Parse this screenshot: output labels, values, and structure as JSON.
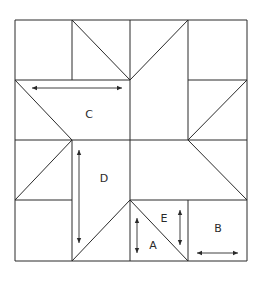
{
  "diagram": {
    "stroke_color": "#2a2a2a",
    "background": "#ffffff",
    "outer_square": {
      "x1": 15,
      "y1": 20,
      "x2": 247,
      "y2": 261
    },
    "grid": {
      "x": [
        15,
        72,
        130,
        188,
        247
      ],
      "y": [
        20,
        80,
        140,
        200,
        261
      ]
    },
    "segments": [
      {
        "name": "top-edge",
        "x1": 15,
        "y1": 20,
        "x2": 247,
        "y2": 20
      },
      {
        "name": "bottom-edge",
        "x1": 15,
        "y1": 261,
        "x2": 247,
        "y2": 261
      },
      {
        "name": "left-edge",
        "x1": 15,
        "y1": 20,
        "x2": 15,
        "y2": 261
      },
      {
        "name": "right-edge",
        "x1": 247,
        "y1": 20,
        "x2": 247,
        "y2": 261
      },
      {
        "name": "row1-v-72",
        "x1": 72,
        "y1": 20,
        "x2": 72,
        "y2": 80
      },
      {
        "name": "row1-v-130",
        "x1": 130,
        "y1": 20,
        "x2": 130,
        "y2": 80
      },
      {
        "name": "row1-v-188",
        "x1": 188,
        "y1": 20,
        "x2": 188,
        "y2": 80
      },
      {
        "name": "row1-diag-left",
        "x1": 72,
        "y1": 20,
        "x2": 130,
        "y2": 80
      },
      {
        "name": "row1-diag-right",
        "x1": 130,
        "y1": 80,
        "x2": 188,
        "y2": 20
      },
      {
        "name": "h80-left",
        "x1": 15,
        "y1": 80,
        "x2": 130,
        "y2": 80
      },
      {
        "name": "h80-right",
        "x1": 188,
        "y1": 80,
        "x2": 247,
        "y2": 80
      },
      {
        "name": "row2-diag-left",
        "x1": 15,
        "y1": 80,
        "x2": 72,
        "y2": 140
      },
      {
        "name": "row2-v-130",
        "x1": 130,
        "y1": 80,
        "x2": 130,
        "y2": 140
      },
      {
        "name": "row2-v-188",
        "x1": 188,
        "y1": 80,
        "x2": 188,
        "y2": 140
      },
      {
        "name": "row2-diag-right",
        "x1": 188,
        "y1": 140,
        "x2": 247,
        "y2": 80
      },
      {
        "name": "h140-full",
        "x1": 15,
        "y1": 140,
        "x2": 247,
        "y2": 140
      },
      {
        "name": "row3-diag-left",
        "x1": 72,
        "y1": 140,
        "x2": 15,
        "y2": 200
      },
      {
        "name": "v72-lower",
        "x1": 72,
        "y1": 140,
        "x2": 72,
        "y2": 261
      },
      {
        "name": "v130-lower",
        "x1": 130,
        "y1": 140,
        "x2": 130,
        "y2": 261
      },
      {
        "name": "row3-diag-right",
        "x1": 188,
        "y1": 140,
        "x2": 247,
        "y2": 200
      },
      {
        "name": "h200-left",
        "x1": 15,
        "y1": 200,
        "x2": 72,
        "y2": 200
      },
      {
        "name": "h200-right",
        "x1": 130,
        "y1": 200,
        "x2": 247,
        "y2": 200
      },
      {
        "name": "row4-diag-left",
        "x1": 130,
        "y1": 200,
        "x2": 72,
        "y2": 261
      },
      {
        "name": "row4-diag-right",
        "x1": 130,
        "y1": 200,
        "x2": 188,
        "y2": 261
      },
      {
        "name": "row4-v-188",
        "x1": 188,
        "y1": 200,
        "x2": 188,
        "y2": 261
      }
    ],
    "labels": [
      {
        "name": "label-c",
        "text": "C",
        "x": 89,
        "y": 114
      },
      {
        "name": "label-d",
        "text": "D",
        "x": 104,
        "y": 178
      },
      {
        "name": "label-e",
        "text": "E",
        "x": 164,
        "y": 218
      },
      {
        "name": "label-a",
        "text": "A",
        "x": 153,
        "y": 245
      },
      {
        "name": "label-b",
        "text": "B",
        "x": 218,
        "y": 228
      }
    ],
    "grain_arrows": [
      {
        "name": "grain-arrow-c",
        "piece": "C",
        "orientation": "horizontal",
        "x1": 32,
        "y1": 88,
        "x2": 122,
        "y2": 88
      },
      {
        "name": "grain-arrow-d",
        "piece": "D",
        "orientation": "vertical",
        "x1": 79,
        "y1": 150,
        "x2": 79,
        "y2": 243
      },
      {
        "name": "grain-arrow-a",
        "piece": "A",
        "orientation": "vertical",
        "x1": 137,
        "y1": 218,
        "x2": 137,
        "y2": 253
      },
      {
        "name": "grain-arrow-e",
        "piece": "E",
        "orientation": "vertical",
        "x1": 180,
        "y1": 210,
        "x2": 180,
        "y2": 245
      },
      {
        "name": "grain-arrow-b",
        "piece": "B",
        "orientation": "horizontal",
        "x1": 197,
        "y1": 253,
        "x2": 238,
        "y2": 253
      }
    ]
  }
}
